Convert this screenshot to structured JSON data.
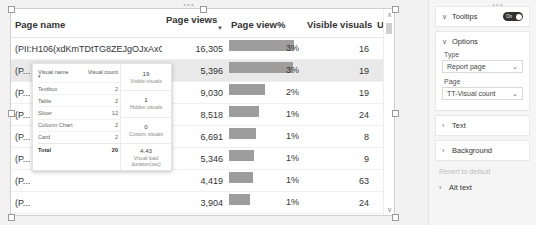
{
  "visual": {
    "columns": [
      {
        "key": "page_name",
        "label": "Page name"
      },
      {
        "key": "page_views",
        "label": "Page views"
      },
      {
        "key": "page_view_pct",
        "label": "Page view%"
      },
      {
        "key": "visible_visuals",
        "label": "Visible visuals"
      },
      {
        "key": "users",
        "label": "Users"
      }
    ],
    "sorted_column": "Page views",
    "rows": [
      {
        "page_name": "(PII:H106(xdKmTDtTG8ZEJgOJxAxO...",
        "page_views": "16,305",
        "page_view_pct": "3%",
        "bar_pct": 86,
        "visible_visuals": "16",
        "users": "1",
        "highlighted": false
      },
      {
        "page_name": "(P...",
        "page_views": "5,396",
        "page_view_pct": "3%",
        "bar_pct": 84,
        "visible_visuals": "19",
        "users": "1",
        "highlighted": true
      },
      {
        "page_name": "(P...",
        "page_views": "9,030",
        "page_view_pct": "2%",
        "bar_pct": 48,
        "visible_visuals": "19",
        "users": "1",
        "highlighted": false
      },
      {
        "page_name": "(P...",
        "page_views": "8,518",
        "page_view_pct": "1%",
        "bar_pct": 40,
        "visible_visuals": "24",
        "users": "1",
        "highlighted": false
      },
      {
        "page_name": "(P...",
        "page_views": "6,691",
        "page_view_pct": "1%",
        "bar_pct": 36,
        "visible_visuals": "8",
        "users": "1",
        "highlighted": false
      },
      {
        "page_name": "(P...",
        "page_views": "5,346",
        "page_view_pct": "1%",
        "bar_pct": 33,
        "visible_visuals": "9",
        "users": "1",
        "highlighted": false
      },
      {
        "page_name": "(P...",
        "page_views": "4,419",
        "page_view_pct": "1%",
        "bar_pct": 31,
        "visible_visuals": "63",
        "users": "1",
        "highlighted": false
      },
      {
        "page_name": "(P...",
        "page_views": "3,904",
        "page_view_pct": "1%",
        "bar_pct": 28,
        "visible_visuals": "24",
        "users": "1",
        "highlighted": false
      },
      {
        "page_name": "(PII:H106(OFFK0ONX+EdO9RCGKaf...",
        "page_views": "3,343",
        "page_view_pct": "1%",
        "bar_pct": 20,
        "visible_visuals": "23",
        "users": "1",
        "highlighted": false
      }
    ],
    "scrollbar": {
      "up": "∧",
      "down": "∨"
    },
    "bar_color": "#9d9d9d"
  },
  "tooltip": {
    "table": {
      "headers": [
        "Visual name",
        "Visual count"
      ],
      "rows": [
        {
          "name": "Textbox",
          "count": "2"
        },
        {
          "name": "Table",
          "count": "2"
        },
        {
          "name": "Slicer",
          "count": "12"
        },
        {
          "name": "Column Chart",
          "count": "2"
        },
        {
          "name": "Card",
          "count": "2"
        }
      ],
      "total_label": "Total",
      "total_count": "20"
    },
    "cards": [
      {
        "value": "19",
        "label": "Visible visuals"
      },
      {
        "value": "1",
        "label": "Hidden visuals"
      },
      {
        "value": "0",
        "label": "Custom visuals"
      },
      {
        "value": "4.43",
        "label": "Visual load duration(sec)"
      }
    ]
  },
  "format_pane": {
    "tooltips": {
      "title": "Tooltips",
      "toggle_label": "On",
      "toggle_on": true
    },
    "options": {
      "title": "Options",
      "type_label": "Type",
      "type_value": "Report page",
      "page_label": "Page",
      "page_value": "TT-Visual count"
    },
    "sections": [
      {
        "title": "Text"
      },
      {
        "title": "Background"
      }
    ],
    "revert_label": "Revert to default",
    "alt_text": {
      "title": "Alt text"
    },
    "chevron_expanded": "∨",
    "chevron_collapsed": "›"
  }
}
